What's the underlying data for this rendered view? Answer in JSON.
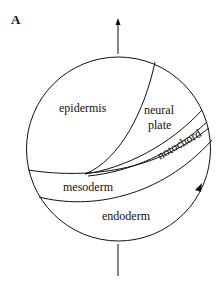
{
  "figure": {
    "panel_label": "A",
    "regions": {
      "epidermis": "epidermis",
      "neural_plate_line1": "neural",
      "neural_plate_line2": "plate",
      "notochord": "notochord",
      "mesoderm": "mesoderm",
      "endoderm": "endoderm"
    },
    "axis": {
      "top_arrow": "arrow-up",
      "bottom_line": "axis-line"
    },
    "marker": "triangle-arrowhead"
  }
}
